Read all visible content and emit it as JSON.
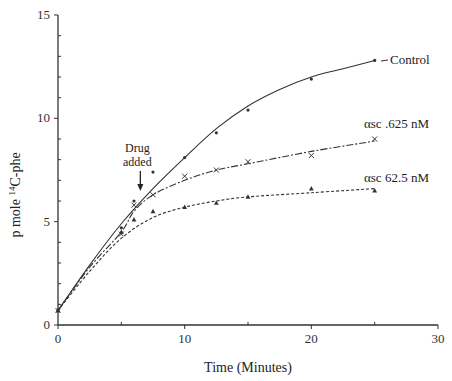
{
  "chart_data": {
    "type": "line",
    "title": "",
    "xlabel": "Time (Minutes)",
    "ylabel": "p mole 14C-phe",
    "ylabel_parts": {
      "pre": "p mole ",
      "sup": "14",
      "post": "C-phe"
    },
    "xlim": [
      0,
      30
    ],
    "ylim": [
      0,
      15
    ],
    "x_ticks": [
      0,
      10,
      20,
      30
    ],
    "x_minor_ticks": [
      5,
      15,
      25
    ],
    "y_ticks": [
      0,
      5,
      10,
      15
    ],
    "y_minor_ticks": [
      1,
      2,
      3,
      4,
      6,
      7,
      8,
      9,
      11,
      12,
      13,
      14
    ],
    "grid": false,
    "legend": "inline labels at line ends",
    "annotation": {
      "text_line1": "Drug",
      "text_line2": "added",
      "x": 6.5,
      "arrow": "down"
    },
    "series": [
      {
        "name": "Control",
        "marker": "dot",
        "line_style": "solid",
        "x": [
          0,
          5,
          6,
          7.5,
          10,
          12.5,
          15,
          20,
          25
        ],
        "values": [
          0.7,
          4.7,
          6.0,
          7.4,
          8.1,
          9.3,
          10.4,
          11.9,
          12.8
        ],
        "curve": [
          [
            0,
            0.7
          ],
          [
            2.5,
            2.9
          ],
          [
            5,
            4.9
          ],
          [
            7.5,
            6.6
          ],
          [
            10,
            8.1
          ],
          [
            12.5,
            9.5
          ],
          [
            15,
            10.6
          ],
          [
            17.5,
            11.4
          ],
          [
            20,
            12.0
          ],
          [
            22.5,
            12.4
          ],
          [
            25,
            12.8
          ]
        ]
      },
      {
        "name": "αsc .625 nM",
        "marker": "x",
        "line_style": "dash-dot",
        "x": [
          0,
          5,
          6,
          7.5,
          10,
          12.5,
          15,
          20,
          25
        ],
        "values": [
          0.7,
          4.4,
          5.8,
          6.3,
          7.2,
          7.5,
          7.9,
          8.2,
          9.0
        ],
        "curve": [
          [
            0,
            0.7
          ],
          [
            2.5,
            2.8
          ],
          [
            5,
            4.5
          ],
          [
            6,
            5.5
          ],
          [
            7.5,
            6.3
          ],
          [
            10,
            7.0
          ],
          [
            12.5,
            7.5
          ],
          [
            15,
            7.8
          ],
          [
            20,
            8.4
          ],
          [
            25,
            8.9
          ]
        ]
      },
      {
        "name": "αsc 62.5 nM",
        "marker": "triangle",
        "line_style": "dotted",
        "x": [
          0,
          5,
          6,
          7.5,
          10,
          12.5,
          15,
          20,
          25
        ],
        "values": [
          0.7,
          4.5,
          5.1,
          5.5,
          5.7,
          5.9,
          6.2,
          6.6,
          6.5
        ],
        "curve": [
          [
            0,
            0.7
          ],
          [
            2.5,
            2.6
          ],
          [
            5,
            4.2
          ],
          [
            7.5,
            5.2
          ],
          [
            10,
            5.7
          ],
          [
            12.5,
            6.0
          ],
          [
            15,
            6.2
          ],
          [
            20,
            6.4
          ],
          [
            25,
            6.6
          ]
        ]
      }
    ]
  }
}
